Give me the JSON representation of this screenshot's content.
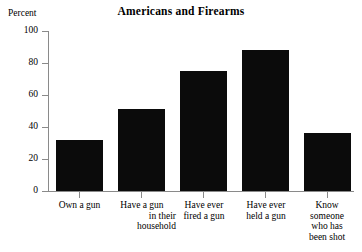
{
  "chart_data": {
    "type": "bar",
    "title": "Americans and Firearms",
    "xlabel": "",
    "ylabel": "Percent",
    "ylim": [
      0,
      100
    ],
    "yticks": [
      0,
      20,
      40,
      60,
      80,
      100
    ],
    "ytick_labels": [
      "0",
      "20",
      "40",
      "60",
      "80",
      "100"
    ],
    "grid": false,
    "legend": "none",
    "bar_color": "#0b0b0b",
    "axis_color": "#8a8a8a",
    "categories": [
      "Own a gun",
      "Have a gun in their household",
      "Have ever fired a gun",
      "Have ever held a gun",
      "Know someone who has been shot"
    ],
    "category_label_lines": [
      [
        "Own a gun"
      ],
      [
        "Have a gun",
        "in their",
        "household"
      ],
      [
        "Have ever",
        "fired a gun"
      ],
      [
        "Have ever",
        "held a gun"
      ],
      [
        "Know",
        "someone",
        "who has",
        "been shot"
      ]
    ],
    "values": [
      32,
      51,
      75,
      88,
      36
    ]
  }
}
